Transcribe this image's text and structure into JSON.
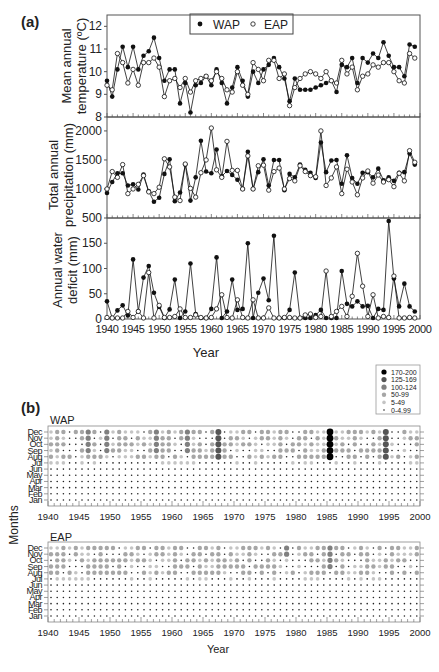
{
  "figure": {
    "panel_a_label": "(a)",
    "panel_b_label": "(b)",
    "x_axis_label": "Year",
    "caption_partial": "Fig. 3. Climatic variability during the 1940-1999 period for the western and eastern populations"
  },
  "chart_data": [
    {
      "type": "line",
      "title": "Mean annual temperature",
      "ylabel": "Mean annual temperature (ºC)",
      "xlabel": "",
      "ylim": [
        8,
        12.5
      ],
      "yticks": [
        8,
        9,
        10,
        11,
        12
      ],
      "xlim": [
        1940,
        2000
      ],
      "legend": [
        "WAP",
        "EAP"
      ],
      "legend_position": "top",
      "x": [
        1940,
        1941,
        1942,
        1943,
        1944,
        1945,
        1946,
        1947,
        1948,
        1949,
        1950,
        1951,
        1952,
        1953,
        1954,
        1955,
        1956,
        1957,
        1958,
        1959,
        1960,
        1961,
        1962,
        1963,
        1964,
        1965,
        1966,
        1967,
        1968,
        1969,
        1970,
        1971,
        1972,
        1973,
        1974,
        1975,
        1976,
        1977,
        1978,
        1979,
        1980,
        1981,
        1982,
        1983,
        1984,
        1985,
        1986,
        1987,
        1988,
        1989,
        1990,
        1991,
        1992,
        1993,
        1994,
        1995,
        1996,
        1997,
        1998,
        1999
      ],
      "series": [
        {
          "name": "WAP",
          "marker": "filled",
          "values": [
            9.6,
            8.9,
            10.1,
            11.1,
            10.2,
            11.1,
            10.1,
            10.7,
            10.9,
            11.5,
            10.6,
            9.6,
            10.1,
            10.1,
            8.6,
            9.5,
            8.2,
            9.4,
            9.5,
            9.8,
            9.4,
            10.1,
            9.5,
            8.6,
            9.3,
            10.2,
            9.6,
            8.9,
            10.0,
            9.5,
            10.1,
            10.3,
            10.6,
            10.2,
            9.7,
            8.7,
            9.7,
            9.2,
            9.2,
            9.2,
            9.3,
            9.4,
            9.5,
            9.6,
            9.1,
            10.3,
            10.2,
            10.6,
            9.5,
            10.6,
            10.4,
            10.8,
            10.6,
            11.3,
            10.7,
            10.2,
            10.2,
            9.8,
            11.2,
            11.1,
            10.2,
            11.6,
            10.8,
            10.6
          ]
        },
        {
          "name": "EAP",
          "marker": "open",
          "values": [
            9.4,
            9.2,
            10.8,
            10.4,
            9.5,
            10.1,
            9.4,
            10.4,
            10.4,
            10.6,
            10.2,
            8.9,
            9.6,
            9.7,
            9.3,
            9.7,
            9.1,
            9.6,
            9.7,
            9.8,
            9.6,
            10.0,
            9.7,
            9.2,
            9.1,
            10.0,
            9.4,
            9.0,
            10.4,
            10.1,
            9.6,
            10.5,
            10.5,
            9.7,
            9.9,
            8.5,
            9.3,
            9.7,
            9.9,
            10.0,
            9.9,
            9.7,
            10.0,
            9.6,
            9.5,
            10.5,
            9.9,
            10.2,
            9.2,
            9.8,
            9.9,
            10.3,
            10.2,
            10.4,
            10.4,
            10.0,
            9.6,
            9.5,
            10.8,
            10.6,
            9.9,
            11.1,
            10.0,
            9.8
          ]
        }
      ]
    },
    {
      "type": "line",
      "title": "Total annual precipitation",
      "ylabel": "Total annual precipitation (mm)",
      "xlabel": "",
      "ylim": [
        500,
        2200
      ],
      "yticks": [
        500,
        1000,
        1500,
        2000
      ],
      "xlim": [
        1940,
        2000
      ],
      "x": [
        1940,
        1941,
        1942,
        1943,
        1944,
        1945,
        1946,
        1947,
        1948,
        1949,
        1950,
        1951,
        1952,
        1953,
        1954,
        1955,
        1956,
        1957,
        1958,
        1959,
        1960,
        1961,
        1962,
        1963,
        1964,
        1965,
        1966,
        1967,
        1968,
        1969,
        1970,
        1971,
        1972,
        1973,
        1974,
        1975,
        1976,
        1977,
        1978,
        1979,
        1980,
        1981,
        1982,
        1983,
        1984,
        1985,
        1986,
        1987,
        1988,
        1989,
        1990,
        1991,
        1992,
        1993,
        1994,
        1995,
        1996,
        1997,
        1998,
        1999
      ],
      "series": [
        {
          "name": "WAP",
          "marker": "filled",
          "values": [
            930,
            1120,
            1270,
            1270,
            1060,
            1080,
            990,
            1250,
            960,
            780,
            850,
            1260,
            1510,
            790,
            940,
            1420,
            800,
            1200,
            1830,
            1300,
            1270,
            1680,
            1220,
            1310,
            1240,
            1160,
            1000,
            1640,
            1000,
            1290,
            1510,
            1060,
            1500,
            1500,
            980,
            1260,
            1200,
            1420,
            1330,
            1280,
            1190,
            1800,
            1290,
            1490,
            1500,
            1090,
            1580,
            1190,
            1090,
            1280,
            1290,
            1200,
            1350,
            1150,
            1200,
            1140,
            1280,
            1290,
            1610,
            1420,
            980,
            1430
          ]
        },
        {
          "name": "EAP",
          "marker": "open",
          "values": [
            1000,
            1300,
            1200,
            1420,
            920,
            1000,
            1080,
            1230,
            950,
            920,
            1030,
            1520,
            1380,
            860,
            800,
            1430,
            1010,
            860,
            1280,
            1500,
            2050,
            1330,
            1200,
            1820,
            1320,
            1320,
            1000,
            1570,
            1000,
            1400,
            1410,
            980,
            1300,
            1360,
            1000,
            1180,
            1140,
            1400,
            1300,
            1230,
            1210,
            2000,
            1060,
            1190,
            1380,
            920,
            1340,
            1120,
            900,
            1190,
            1310,
            1100,
            1240,
            1120,
            1160,
            1040,
            1270,
            1140,
            1660,
            1460,
            900,
            1290
          ]
        }
      ]
    },
    {
      "type": "line",
      "title": "Annual water deficit",
      "ylabel": "Annual water deficit (mm)",
      "xlabel": "Year",
      "ylim": [
        0,
        200
      ],
      "yticks": [
        0,
        50,
        100,
        150
      ],
      "xlim": [
        1940,
        2000
      ],
      "xticks": [
        1940,
        1945,
        1950,
        1955,
        1960,
        1965,
        1970,
        1975,
        1980,
        1985,
        1990,
        1995,
        2000
      ],
      "x": [
        1940,
        1941,
        1942,
        1943,
        1944,
        1945,
        1946,
        1947,
        1948,
        1949,
        1950,
        1951,
        1952,
        1953,
        1954,
        1955,
        1956,
        1957,
        1958,
        1959,
        1960,
        1961,
        1962,
        1963,
        1964,
        1965,
        1966,
        1967,
        1968,
        1969,
        1970,
        1971,
        1972,
        1973,
        1974,
        1975,
        1976,
        1977,
        1978,
        1979,
        1980,
        1981,
        1982,
        1983,
        1984,
        1985,
        1986,
        1987,
        1988,
        1989,
        1990,
        1991,
        1992,
        1993,
        1994,
        1995,
        1996,
        1997,
        1998,
        1999
      ],
      "series": [
        {
          "name": "WAP",
          "marker": "filled",
          "values": [
            35,
            2,
            17,
            27,
            7,
            118,
            15,
            82,
            105,
            52,
            24,
            2,
            19,
            78,
            2,
            15,
            110,
            10,
            2,
            2,
            20,
            122,
            2,
            15,
            78,
            18,
            20,
            150,
            2,
            52,
            80,
            37,
            165,
            2,
            2,
            18,
            92,
            2,
            2,
            2,
            8,
            18,
            2,
            2,
            2,
            95,
            30,
            25,
            35,
            25,
            26,
            2,
            20,
            18,
            194,
            80,
            25,
            70,
            25,
            15,
            2,
            12,
            25,
            68,
            130,
            100,
            2,
            2,
            45,
            2
          ]
        },
        {
          "name": "EAP",
          "marker": "open",
          "values": [
            3,
            2,
            2,
            2,
            15,
            3,
            15,
            2,
            92,
            2,
            27,
            3,
            3,
            5,
            20,
            3,
            3,
            8,
            3,
            2,
            3,
            20,
            48,
            3,
            2,
            38,
            3,
            2,
            38,
            2,
            2,
            22,
            2,
            2,
            3,
            3,
            2,
            2,
            8,
            10,
            3,
            5,
            95,
            5,
            15,
            25,
            5,
            45,
            130,
            65,
            5,
            48,
            2,
            5,
            3,
            85,
            2,
            2,
            3,
            2
          ]
        }
      ]
    },
    {
      "type": "scatter",
      "title": "WAP monthly water deficit (bubble)",
      "subtitle": "WAP",
      "ylabel": "Months",
      "xlabel": "",
      "yticks": [
        "Dec",
        "Nov",
        "Oct",
        "Sep",
        "Aug",
        "Jul",
        "Jun",
        "May",
        "Apr",
        "Mar",
        "Feb",
        "Jan"
      ],
      "xticks": [
        1940,
        1945,
        1950,
        1955,
        1960,
        1965,
        1970,
        1975,
        1980,
        1985,
        1990,
        1995,
        2000
      ],
      "legend": [
        "170-200",
        "125-169",
        "100-124",
        "50-99",
        "5-49",
        "0-4.99"
      ],
      "legend_position": "upper right",
      "highlights": [
        {
          "year": 1985,
          "months": [
            "Aug",
            "Sep",
            "Oct",
            "Nov",
            "Dec"
          ],
          "class": "170-200"
        },
        {
          "year": 1994,
          "months": [
            "Aug",
            "Sep",
            "Oct",
            "Nov",
            "Dec"
          ],
          "class": "125-169"
        },
        {
          "year": 1967,
          "months": [
            "Aug",
            "Sep",
            "Oct",
            "Nov",
            "Dec"
          ],
          "class": "125-169"
        },
        {
          "year": 1962,
          "months": [
            "Sep",
            "Oct",
            "Nov",
            "Dec"
          ],
          "class": "100-124"
        },
        {
          "year": 1957,
          "months": [
            "Sep",
            "Oct",
            "Nov",
            "Dec"
          ],
          "class": "100-124"
        },
        {
          "year": 1949,
          "months": [
            "Sep",
            "Oct",
            "Nov",
            "Dec"
          ],
          "class": "100-124"
        },
        {
          "year": 1946,
          "months": [
            "Sep",
            "Oct",
            "Nov",
            "Dec"
          ],
          "class": "100-124"
        }
      ]
    },
    {
      "type": "scatter",
      "title": "EAP monthly water deficit (bubble)",
      "subtitle": "EAP",
      "ylabel": "Months",
      "xlabel": "Year",
      "yticks": [
        "Dec",
        "Nov",
        "Oct",
        "Sep",
        "Aug",
        "Jul",
        "Jun",
        "May",
        "Apr",
        "Mar",
        "Feb",
        "Jan"
      ],
      "xticks": [
        1940,
        1945,
        1950,
        1955,
        1960,
        1965,
        1970,
        1975,
        1980,
        1985,
        1990,
        1995,
        2000
      ],
      "highlights": [
        {
          "year": 1985,
          "months": [
            "Sep",
            "Oct",
            "Nov",
            "Dec"
          ],
          "class": "100-124"
        },
        {
          "year": 1978,
          "months": [
            "Nov",
            "Dec"
          ],
          "class": "100-124"
        },
        {
          "year": 1948,
          "months": [
            "Sep",
            "Oct",
            "Nov",
            "Dec"
          ],
          "class": "50-99"
        },
        {
          "year": 1967,
          "months": [
            "Oct",
            "Nov",
            "Dec"
          ],
          "class": "50-99"
        }
      ]
    }
  ],
  "labels": {
    "temp_ylabel_1": "Mean annual",
    "temp_ylabel_2": "temperature (ºC)",
    "prec_ylabel_1": "Total annual",
    "prec_ylabel_2": "precipitation (mm)",
    "def_ylabel_1": "Annual water",
    "def_ylabel_2": "deficit (mm)",
    "months_label": "Months",
    "wap": "WAP",
    "eap": "EAP",
    "legend_wap": "WAP",
    "legend_eap": "EAP"
  },
  "colors": {
    "axis": "#555555",
    "line": "#111111",
    "bubble_170_200": "#000000",
    "bubble_125_169": "#555555",
    "bubble_100_124": "#808080",
    "bubble_50_99": "#a6a6a6",
    "bubble_5_49": "#c4c4c4",
    "bubble_0_5": "#222222"
  }
}
